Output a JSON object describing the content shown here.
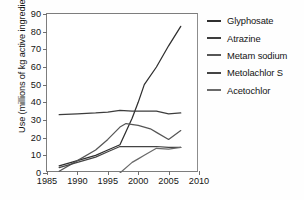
{
  "figure": {
    "background": "#ffffff",
    "plot_background": "#ffffff",
    "frame_color": "#7d7d7d"
  },
  "axes": {
    "ylabel": "Use (millions of kg active ingredient)",
    "xlabel": "",
    "yticks": [
      0,
      10,
      20,
      30,
      40,
      50,
      60,
      70,
      80,
      90
    ],
    "xticks": [
      1985,
      1990,
      1995,
      2000,
      2005,
      2010
    ]
  },
  "legend": {
    "position": "right",
    "entries": [
      {
        "label": "Glyphosate",
        "color": "#2f2f2f"
      },
      {
        "label": "Atrazine",
        "color": "#3d3d3d"
      },
      {
        "label": "Metam sodium",
        "color": "#565656"
      },
      {
        "label": "Metolachlor S",
        "color": "#444444"
      },
      {
        "label": "Acetochlor",
        "color": "#6a6a6a"
      }
    ]
  },
  "chart_data": {
    "type": "line",
    "title": "",
    "xlabel": "",
    "ylabel": "Use (millions of kg active ingredient)",
    "xlim": [
      1985,
      2010
    ],
    "ylim": [
      0,
      90
    ],
    "xticks": [
      1985,
      1990,
      1995,
      2000,
      2005,
      2010
    ],
    "yticks": [
      0,
      10,
      20,
      30,
      40,
      50,
      60,
      70,
      80,
      90
    ],
    "grid": false,
    "legend_position": "right",
    "series": [
      {
        "name": "Glyphosate",
        "color": "#2f2f2f",
        "x": [
          1987,
          1990,
          1993,
          1995,
          1997,
          1999,
          2000,
          2001,
          2003,
          2005,
          2007
        ],
        "values": [
          4,
          7,
          10,
          13,
          16,
          31,
          40,
          50,
          60,
          72,
          83
        ]
      },
      {
        "name": "Atrazine",
        "color": "#3d3d3d",
        "x": [
          1987,
          1990,
          1993,
          1995,
          1997,
          1999,
          2001,
          2003,
          2005,
          2007
        ],
        "values": [
          33,
          33.5,
          34,
          34.5,
          35.5,
          35,
          35,
          35,
          33.5,
          34
        ]
      },
      {
        "name": "Metam sodium",
        "color": "#565656",
        "x": [
          1987,
          1990,
          1993,
          1995,
          1997,
          1998,
          2000,
          2002,
          2003,
          2005,
          2007
        ],
        "values": [
          1,
          7,
          13,
          19,
          26,
          28,
          27,
          25,
          23,
          19,
          24
        ]
      },
      {
        "name": "Metolachlor S",
        "color": "#444444",
        "x": [
          1987,
          1990,
          1993,
          1995,
          1997,
          1999,
          2001,
          2003,
          2005,
          2007
        ],
        "values": [
          3,
          6,
          9,
          12,
          15,
          15,
          15,
          15,
          14.5,
          14.5
        ]
      },
      {
        "name": "Acetochlor",
        "color": "#6a6a6a",
        "x": [
          1997,
          1999,
          2000,
          2001,
          2003,
          2005,
          2007
        ],
        "values": [
          0,
          6,
          8,
          10,
          14,
          13.5,
          14.5
        ]
      }
    ]
  }
}
